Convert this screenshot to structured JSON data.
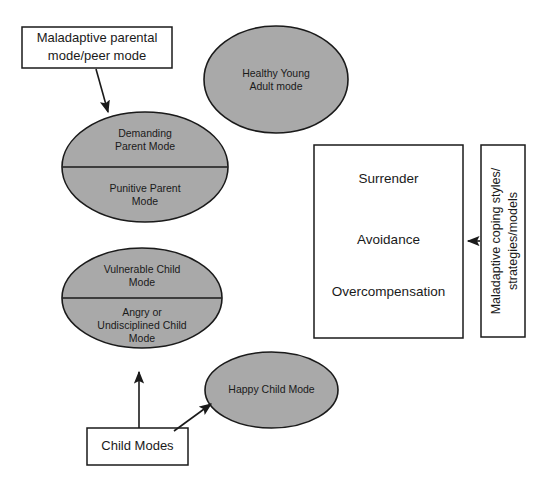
{
  "figure": {
    "kind": "schema-therapy-mode-diagram",
    "background_color": "#ffffff",
    "ellipse_fill_color": "#a9a9a9",
    "stroke_color": "#1a1a1a",
    "box_fill_color": "#ffffff"
  },
  "labels": {
    "maladaptive_parental": {
      "line1": "Maladaptive parental",
      "line2": "mode/peer mode"
    },
    "child_modes": "Child Modes",
    "maladaptive_coping": {
      "line1": "Maladaptive coping styles/",
      "line2": "strategies/models"
    }
  },
  "nodes": {
    "healthy_young_adult": {
      "line1": "Healthy Young",
      "line2": "Adult mode"
    },
    "parent_ellipse": {
      "top": {
        "line1": "Demanding",
        "line2": "Parent Mode"
      },
      "bottom": {
        "line1": "Punitive Parent",
        "line2": "Mode"
      }
    },
    "child_ellipse": {
      "top": {
        "line1": "Vulnerable Child",
        "line2": "Mode"
      },
      "bottom": {
        "line1": "Angry or",
        "line2": "Undisciplined Child",
        "line3": "Mode"
      }
    },
    "happy_child": {
      "line1": "Happy Child Mode"
    }
  },
  "coping_box": {
    "items": [
      "Surrender",
      "Avoidance",
      "Overcompensation"
    ]
  }
}
